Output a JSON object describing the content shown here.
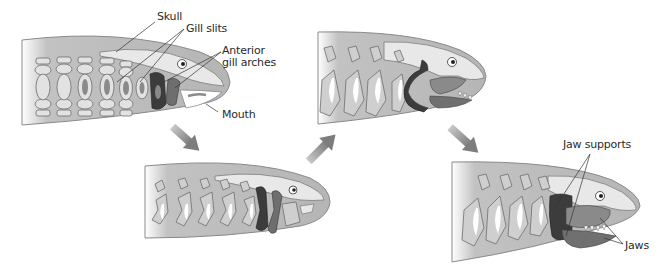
{
  "diagram": {
    "stages": [
      {
        "id": 1,
        "description": "Jawless ancestor with gill slits and gill arches"
      },
      {
        "id": 2,
        "description": "Anterior gill arches enlarge"
      },
      {
        "id": 3,
        "description": "Anterior arches form early jaws"
      },
      {
        "id": 4,
        "description": "Jaws with jaw supports"
      }
    ],
    "labels": {
      "skull": "Skull",
      "gill_slits": "Gill slits",
      "anterior_1": "Anterior",
      "anterior_2": "gill arches",
      "mouth": "Mouth",
      "jaw_supports": "Jaw supports",
      "jaws": "Jaws"
    },
    "arrows": [
      {
        "from": 1,
        "to": 2,
        "direction": "down-right"
      },
      {
        "from": 2,
        "to": 3,
        "direction": "up-right"
      },
      {
        "from": 3,
        "to": 4,
        "direction": "down-right"
      }
    ],
    "colors": {
      "body": "#b9b9b9",
      "outline": "#7a7a7a",
      "skull": "#e8e8e8",
      "arch_dark": "#3c3c3c",
      "arch_mid": "#6e6e6e",
      "jaw": "#8a8a8a",
      "arrow": "#8c8c8c",
      "white": "#ffffff"
    }
  }
}
